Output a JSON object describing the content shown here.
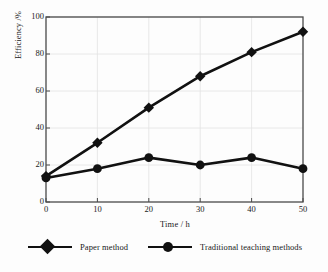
{
  "chart_data": {
    "type": "line",
    "title": "",
    "xlabel": "Time / h",
    "ylabel": "Efficiency /%",
    "x": [
      0,
      10,
      20,
      30,
      40,
      50
    ],
    "xticks": [
      "0",
      "10",
      "20",
      "30",
      "40",
      "50"
    ],
    "yticks": [
      "0",
      "20",
      "40",
      "60",
      "80",
      "100"
    ],
    "xlim": [
      0,
      50
    ],
    "ylim": [
      0,
      100
    ],
    "grid": true,
    "legend_position": "below",
    "series": [
      {
        "name": "Paper method",
        "marker": "diamond",
        "color": "#111111",
        "values": [
          14,
          32,
          51,
          68,
          81,
          92
        ]
      },
      {
        "name": "Traditional teaching methods",
        "marker": "circle",
        "color": "#111111",
        "values": [
          13,
          18,
          24,
          20,
          24,
          18
        ]
      }
    ]
  },
  "legend": {
    "items": [
      {
        "label": "Paper method",
        "marker": "diamond"
      },
      {
        "label": "Traditional teaching methods",
        "marker": "circle"
      }
    ]
  }
}
